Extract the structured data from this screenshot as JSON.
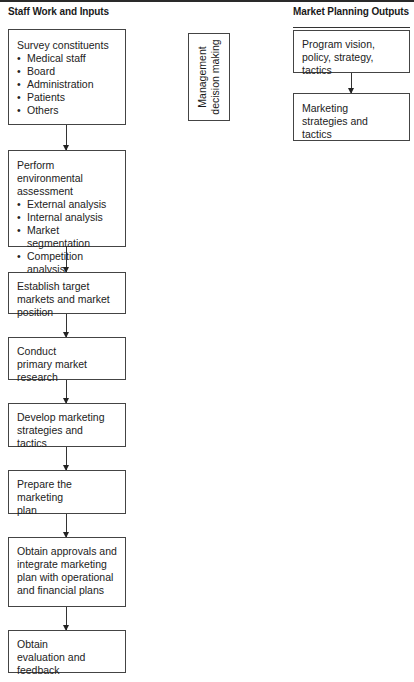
{
  "header": {
    "left_column_title": "Staff Work and Inputs",
    "right_column_title": "Market Planning Outputs"
  },
  "staff_steps": [
    {
      "title": "Survey constituents",
      "bullets": [
        "Medical staff",
        "Board",
        "Administration",
        "Patients",
        "Others"
      ]
    },
    {
      "title": "Perform environmental assessment",
      "bullets": [
        "External analysis",
        "Internal analysis",
        "Market segmentation",
        "Competition analysis"
      ]
    },
    {
      "title": "Establish target markets and market position",
      "bullets": []
    },
    {
      "title": "Conduct primary market research",
      "bullets": []
    },
    {
      "title": "Develop marketing strategies and tactics",
      "bullets": []
    },
    {
      "title": "Prepare the marketing plan",
      "bullets": []
    },
    {
      "title": "Obtain approvals and integrate marketing plan with operational and financial plans",
      "bullets": []
    },
    {
      "title": "Obtain evaluation and feedback",
      "bullets": []
    }
  ],
  "management_box": {
    "line1": "Management",
    "line2": "decision making"
  },
  "outputs": [
    {
      "title": "Program vision, policy, strategy, tactics"
    },
    {
      "title": "Marketing strategies and tactics"
    }
  ]
}
